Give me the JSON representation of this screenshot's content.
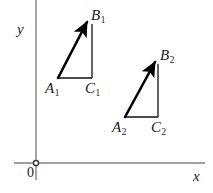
{
  "figure": {
    "type": "geometry-diagram",
    "background_color": "#ffffff",
    "width": 213,
    "height": 193,
    "axis_color": "#808080",
    "shape_color": "#000000"
  },
  "axes": {
    "x_axis": {
      "label": "x",
      "y_position": 163,
      "x_start": 14,
      "x_end": 205
    },
    "y_axis": {
      "label": "y",
      "x_position": 36,
      "y_start": 0,
      "y_end": 180
    },
    "origin": {
      "label": "0",
      "x": 36,
      "y": 163,
      "marker": "open-circle"
    }
  },
  "triangles": [
    {
      "name": "triangle-1",
      "vertices": {
        "A": {
          "label": "A",
          "subscript": "1",
          "x": 58,
          "y": 78
        },
        "B": {
          "label": "B",
          "subscript": "1",
          "x": 88,
          "y": 20
        },
        "C": {
          "label": "C",
          "subscript": "1",
          "x": 92,
          "y": 78
        }
      },
      "vector": {
        "from": "A",
        "to": "B",
        "arrow": true
      }
    },
    {
      "name": "triangle-2",
      "vertices": {
        "A": {
          "label": "A",
          "subscript": "2",
          "x": 125,
          "y": 117
        },
        "B": {
          "label": "B",
          "subscript": "2",
          "x": 156,
          "y": 60
        },
        "C": {
          "label": "C",
          "subscript": "2",
          "x": 158,
          "y": 117
        }
      },
      "vector": {
        "from": "A",
        "to": "B",
        "arrow": true
      }
    }
  ]
}
